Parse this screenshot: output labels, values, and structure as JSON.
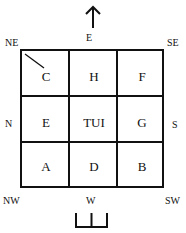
{
  "directions": {
    "top": "E",
    "bottom": "W",
    "left": "N",
    "right": "S",
    "top_left": "NE",
    "top_right": "SE",
    "bottom_left": "NW",
    "bottom_right": "SW"
  },
  "grid": {
    "rows": [
      [
        "C",
        "H",
        "F"
      ],
      [
        "E",
        "TUI",
        "G"
      ],
      [
        "A",
        "D",
        "B"
      ]
    ]
  },
  "symbols": {
    "top": "up-arrow",
    "bottom": "entrance-bracket",
    "corner_mark": "diagonal-line-in-C"
  },
  "colors": {
    "line": "#111111",
    "background": "#ffffff"
  }
}
